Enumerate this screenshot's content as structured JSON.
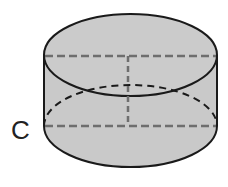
{
  "figure": {
    "label": "C",
    "shape": "cylinder",
    "fill_color": "#c9c9c9",
    "outline_color": "#1a1a1a",
    "hidden_line_color": "#6e6e6e"
  }
}
